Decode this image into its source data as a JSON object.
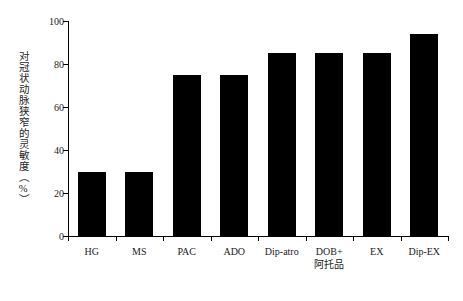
{
  "chart_data": {
    "type": "bar",
    "title": "",
    "subtitle": "",
    "xlabel": "",
    "ylabel": "对冠状动脉狭窄的灵敏度（%）",
    "categories": [
      "HG",
      "MS",
      "PAC",
      "ADO",
      "Dip-atro",
      "DOB+\n阿托品",
      "EX",
      "Dip-EX"
    ],
    "category_lines": [
      [
        "HG"
      ],
      [
        "MS"
      ],
      [
        "PAC"
      ],
      [
        "ADO"
      ],
      [
        "Dip-atro"
      ],
      [
        "DOB+",
        "阿托品"
      ],
      [
        "EX"
      ],
      [
        "Dip-EX"
      ]
    ],
    "values": [
      30,
      30,
      75,
      75,
      85,
      85,
      85,
      94
    ],
    "ylim": [
      0,
      100
    ],
    "ytick_labels": [
      "0",
      "20",
      "40",
      "60",
      "80",
      "100"
    ],
    "ytick_values": [
      0,
      20,
      40,
      60,
      80,
      100
    ],
    "grid": false,
    "legend": null,
    "bar_color": "#000000",
    "axis_color": "#000000",
    "background_color": "#ffffff"
  }
}
